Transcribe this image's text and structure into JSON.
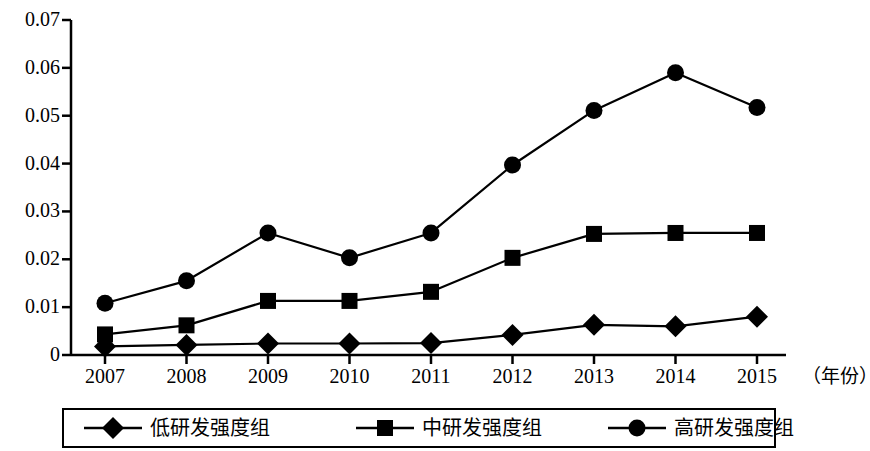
{
  "chart_data": {
    "type": "line",
    "title": "",
    "subtitle": "",
    "xlabel": "（年份）",
    "ylabel": "",
    "categories": [
      "2007",
      "2008",
      "2009",
      "2010",
      "2011",
      "2012",
      "2013",
      "2014",
      "2015"
    ],
    "x": [
      2007,
      2008,
      2009,
      2010,
      2011,
      2012,
      2013,
      2014,
      2015
    ],
    "xlim": [
      2007,
      2015
    ],
    "ylim": [
      0,
      0.07
    ],
    "yticks": [
      0,
      0.01,
      0.02,
      0.03,
      0.04,
      0.05,
      0.06,
      0.07
    ],
    "ytick_labels": [
      "0",
      "0.01",
      "0.02",
      "0.03",
      "0.04",
      "0.05",
      "0.06",
      "0.07"
    ],
    "grid": false,
    "legend_position": "bottom",
    "series": [
      {
        "name": "低研发强度组",
        "marker": "diamond",
        "color": "#000000",
        "values": [
          0.0018,
          0.0021,
          0.0024,
          0.0024,
          0.0025,
          0.0042,
          0.0063,
          0.006,
          0.008
        ]
      },
      {
        "name": "中研发强度组",
        "marker": "square",
        "color": "#000000",
        "values": [
          0.0043,
          0.0062,
          0.0113,
          0.0113,
          0.0132,
          0.0203,
          0.0253,
          0.0255,
          0.0255
        ]
      },
      {
        "name": "高研发强度组",
        "marker": "circle",
        "color": "#000000",
        "values": [
          0.0108,
          0.0155,
          0.0255,
          0.0203,
          0.0255,
          0.0397,
          0.0511,
          0.059,
          0.0517
        ]
      }
    ]
  },
  "axes": {
    "x_annotation": "（年份）",
    "y_tick_labels": [
      "0.07",
      "0.06",
      "0.05",
      "0.04",
      "0.03",
      "0.02",
      "0.01",
      "0"
    ],
    "x_tick_labels": [
      "2007",
      "2008",
      "2009",
      "2010",
      "2011",
      "2012",
      "2013",
      "2014",
      "2015"
    ],
    "axis_color": "#000000"
  },
  "legend": {
    "entries": [
      {
        "label": "低研发强度组",
        "marker": "diamond-marker"
      },
      {
        "label": "中研发强度组",
        "marker": "square-marker"
      },
      {
        "label": "高研发强度组",
        "marker": "circle-marker"
      }
    ]
  }
}
